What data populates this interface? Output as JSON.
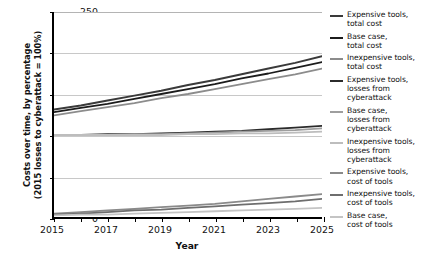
{
  "chart_data": {
    "type": "line",
    "title": "",
    "xlabel": "Year",
    "ylabel": "Costs over time, by percentage (2015 losses to cyberattack = 100%)",
    "ylabel_line1": "Costs over time, by percentage",
    "ylabel_line2": "(2015 losses to cyberattack = 100%)",
    "xlim": [
      2015,
      2025
    ],
    "ylim": [
      0,
      250
    ],
    "yticks": [
      0,
      50,
      100,
      150,
      200,
      250
    ],
    "xticks": [
      2015,
      2017,
      2019,
      2021,
      2023,
      2025
    ],
    "xticks_all": [
      2015,
      2016,
      2017,
      2018,
      2019,
      2020,
      2021,
      2022,
      2023,
      2024,
      2025
    ],
    "grid": "horizontal",
    "legend_position": "right",
    "x": [
      2015,
      2016,
      2017,
      2018,
      2019,
      2020,
      2021,
      2022,
      2023,
      2024,
      2025
    ],
    "series": [
      {
        "name": "Expensive tools, total cost",
        "color": "#3a3a3a",
        "width": 2.0,
        "values": [
          131,
          136,
          142,
          148,
          154,
          161,
          167,
          174,
          181,
          188,
          196
        ]
      },
      {
        "name": "Base case, total cost",
        "color": "#1c1c1c",
        "width": 1.8,
        "values": [
          128,
          133,
          138,
          144,
          150,
          156,
          162,
          169,
          175,
          182,
          189
        ]
      },
      {
        "name": "Inexpensive tools, total cost",
        "color": "#8c8c8c",
        "width": 1.8,
        "values": [
          124,
          129,
          134,
          139,
          145,
          150,
          156,
          162,
          168,
          174,
          181
        ]
      },
      {
        "name": "Expensive tools, losses from cyberattack",
        "color": "#2b2b2b",
        "width": 1.8,
        "values": [
          100,
          100,
          101,
          101,
          102,
          103,
          104,
          105,
          107,
          109,
          111
        ]
      },
      {
        "name": "Base case, losses from cyberattack",
        "color": "#9e9e9e",
        "width": 1.8,
        "values": [
          100,
          100,
          100,
          101,
          101,
          102,
          103,
          104,
          105,
          106,
          108
        ]
      },
      {
        "name": "Inexpensive tools, losses from cyberattack",
        "color": "#bdbdbd",
        "width": 1.8,
        "values": [
          100,
          100,
          100,
          100,
          100,
          101,
          101,
          102,
          102,
          103,
          104
        ]
      },
      {
        "name": "Expensive tools, cost of tools",
        "color": "#8a8a8a",
        "width": 1.8,
        "values": [
          4,
          6,
          8,
          10,
          12,
          14,
          16,
          19,
          22,
          25,
          28
        ]
      },
      {
        "name": "Inexpensive tools, cost of tools",
        "color": "#6e6e6e",
        "width": 1.8,
        "values": [
          3,
          4,
          6,
          8,
          9,
          11,
          13,
          15,
          17,
          19,
          22
        ]
      },
      {
        "name": "Base case, cost of tools",
        "color": "#c4c4c4",
        "width": 1.8,
        "values": [
          2,
          3,
          3,
          4,
          5,
          6,
          7,
          8,
          9,
          10,
          11
        ]
      }
    ]
  },
  "legend": {
    "items": [
      {
        "label": "Expensive tools,\ntotal cost",
        "color": "#3a3a3a"
      },
      {
        "label": "Base case,\ntotal cost",
        "color": "#1c1c1c"
      },
      {
        "label": "Inexpensive tools,\ntotal cost",
        "color": "#8c8c8c"
      },
      {
        "label": "Expensive tools,\nlosses from\ncyberattack",
        "color": "#2b2b2b"
      },
      {
        "label": "Base case,\nlosses from\ncyberattack",
        "color": "#9e9e9e"
      },
      {
        "label": "Inexpensive tools,\nlosses from\ncyberattack",
        "color": "#bdbdbd"
      },
      {
        "label": "Expensive tools,\ncost of tools",
        "color": "#8a8a8a"
      },
      {
        "label": "Inexpensive tools,\ncost of tools",
        "color": "#6e6e6e"
      },
      {
        "label": "Base case,\ncost of tools",
        "color": "#c4c4c4"
      }
    ]
  }
}
